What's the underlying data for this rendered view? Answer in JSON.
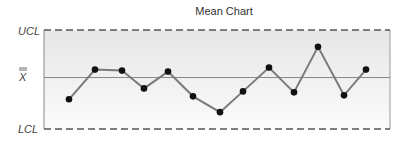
{
  "chart_data": {
    "type": "line",
    "title": "Mean Chart",
    "xlabel": "",
    "ylabel": "",
    "y_tick_labels": [
      "UCL",
      "X̄",
      "LCL"
    ],
    "ylim": [
      0,
      100
    ],
    "control_limits": {
      "UCL": 100,
      "center": 52,
      "LCL": 0
    },
    "x": [
      1,
      2,
      3,
      4,
      5,
      6,
      7,
      8,
      9,
      10,
      11,
      12,
      13
    ],
    "values": [
      30,
      60,
      59,
      41,
      58,
      33,
      17,
      38,
      62,
      37,
      83,
      34,
      60
    ],
    "grid": false,
    "legend": "none",
    "colors": {
      "line": "#777777",
      "marker": "#111111",
      "limit_line": "#555555",
      "center_line": "#888888",
      "band_top": "#e6e6e6",
      "band_bottom": "#fafafa"
    }
  },
  "labels": {
    "title": "Mean Chart",
    "ucl": "UCL",
    "xbar": "X",
    "lcl": "LCL"
  }
}
